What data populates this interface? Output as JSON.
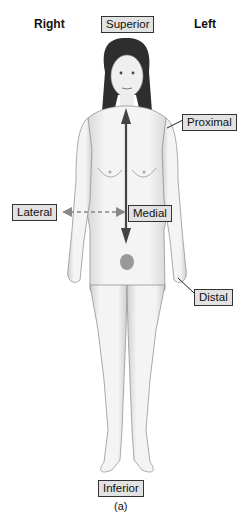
{
  "orientation": {
    "right": "Right",
    "left": "Left"
  },
  "labels": {
    "superior": "Superior",
    "proximal": "Proximal",
    "lateral": "Lateral",
    "medial": "Medial",
    "distal": "Distal",
    "inferior": "Inferior"
  },
  "caption": "(a)",
  "colors": {
    "label_bg": "#e2e2e2",
    "label_border": "#333333",
    "arrow": "#444444",
    "dashed_arrow": "#888888"
  }
}
